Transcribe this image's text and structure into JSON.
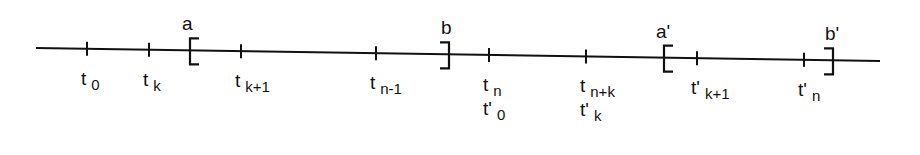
{
  "diagram": {
    "type": "number-line-partition",
    "line": {
      "x1": 36,
      "y1": 48,
      "x2": 880,
      "y2": 61,
      "color": "#111111"
    },
    "ticks": [
      {
        "id": "t0",
        "x": 87,
        "label_main": "t",
        "label_sub": "0",
        "label2_main": "",
        "label2_sub": ""
      },
      {
        "id": "tk",
        "x": 149,
        "label_main": "t",
        "label_sub": "k",
        "label2_main": "",
        "label2_sub": ""
      },
      {
        "id": "tk1",
        "x": 241,
        "label_main": "t",
        "label_sub": "k+1",
        "label2_main": "",
        "label2_sub": ""
      },
      {
        "id": "tn1",
        "x": 376,
        "label_main": "t",
        "label_sub": "n-1",
        "label2_main": "",
        "label2_sub": ""
      },
      {
        "id": "tn",
        "x": 489,
        "label_main": "t",
        "label_sub": "n",
        "label2_main": "t'",
        "label2_sub": "0"
      },
      {
        "id": "tnk",
        "x": 586,
        "label_main": "t",
        "label_sub": "n+k",
        "label2_main": "t'",
        "label2_sub": "k"
      },
      {
        "id": "tpk1",
        "x": 697,
        "label_main": "t'",
        "label_sub": "k+1",
        "label2_main": "",
        "label2_sub": ""
      },
      {
        "id": "tpn",
        "x": 804,
        "label_main": "t'",
        "label_sub": "n",
        "label2_main": "",
        "label2_sub": ""
      }
    ],
    "brackets": [
      {
        "id": "a",
        "label": "a",
        "x": 190,
        "side": "left"
      },
      {
        "id": "b",
        "label": "b",
        "x": 449,
        "side": "right"
      },
      {
        "id": "ap",
        "label": "a'",
        "x": 664,
        "side": "left"
      },
      {
        "id": "bp",
        "label": "b'",
        "x": 833,
        "side": "right"
      }
    ]
  }
}
